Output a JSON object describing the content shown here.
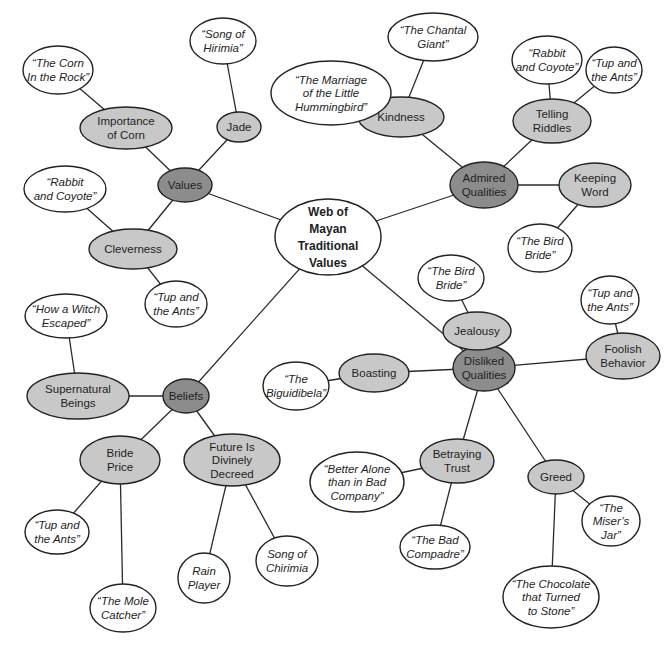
{
  "colors": {
    "center_fill": "#ffffff",
    "category_fill": "#8c8c8c",
    "subtopic_fill": "#c8c8c8",
    "story_fill": "#ffffff",
    "stroke": "#222222"
  },
  "nodes": [
    {
      "id": "center",
      "type": "center",
      "lines": [
        "Web of",
        "Mayan",
        "Traditional",
        "Values"
      ],
      "cx": 328,
      "cy": 237,
      "rx": 53,
      "ry": 38
    },
    {
      "id": "values",
      "type": "category",
      "lines": [
        "Values"
      ],
      "cx": 185,
      "cy": 185,
      "rx": 27,
      "ry": 17
    },
    {
      "id": "jade",
      "type": "subtopic",
      "lines": [
        "Jade"
      ],
      "cx": 239,
      "cy": 127,
      "rx": 22,
      "ry": 15
    },
    {
      "id": "song-hirimia",
      "type": "story",
      "lines": [
        "“Song of",
        "Hirimia”"
      ],
      "cx": 223,
      "cy": 41,
      "rx": 33,
      "ry": 23
    },
    {
      "id": "importance-corn",
      "type": "subtopic",
      "lines": [
        "Importance",
        "of Corn"
      ],
      "cx": 126,
      "cy": 128,
      "rx": 46,
      "ry": 21
    },
    {
      "id": "corn-rock",
      "type": "story",
      "lines": [
        "“The Corn",
        "In the Rock”"
      ],
      "cx": 58,
      "cy": 70,
      "rx": 35,
      "ry": 24
    },
    {
      "id": "cleverness",
      "type": "subtopic",
      "lines": [
        "Cleverness"
      ],
      "cx": 133,
      "cy": 249,
      "rx": 44,
      "ry": 20
    },
    {
      "id": "rabbit-coyote-left",
      "type": "story",
      "lines": [
        "“Rabbit",
        "and Coyote”"
      ],
      "cx": 65,
      "cy": 189,
      "rx": 41,
      "ry": 23
    },
    {
      "id": "tup-ants-cleverness",
      "type": "story",
      "lines": [
        "“Tup and",
        "the Ants”"
      ],
      "cx": 176,
      "cy": 304,
      "rx": 31,
      "ry": 23
    },
    {
      "id": "admired",
      "type": "category",
      "lines": [
        "Admired",
        "Qualities"
      ],
      "cx": 484,
      "cy": 185,
      "rx": 34,
      "ry": 23
    },
    {
      "id": "kindness",
      "type": "subtopic",
      "lines": [
        "Kindness"
      ],
      "cx": 401,
      "cy": 117,
      "rx": 43,
      "ry": 20
    },
    {
      "id": "chantal-giant",
      "type": "story",
      "lines": [
        "“The Chantal",
        "Giant”"
      ],
      "cx": 433,
      "cy": 37,
      "rx": 45,
      "ry": 24
    },
    {
      "id": "marriage-hummingbird",
      "type": "story",
      "lines": [
        "“The Marriage",
        "of the Little",
        "Hummingbird”"
      ],
      "cx": 331,
      "cy": 93,
      "rx": 60,
      "ry": 32
    },
    {
      "id": "telling-riddles",
      "type": "subtopic",
      "lines": [
        "Telling",
        "Riddles"
      ],
      "cx": 552,
      "cy": 121,
      "rx": 39,
      "ry": 22
    },
    {
      "id": "rabbit-coyote-right",
      "type": "story",
      "lines": [
        "“Rabbit",
        "and Coyote”"
      ],
      "cx": 547,
      "cy": 60,
      "rx": 35,
      "ry": 24
    },
    {
      "id": "tup-ants-riddles",
      "type": "story",
      "lines": [
        "“Tup and",
        "the Ants”"
      ],
      "cx": 614,
      "cy": 70,
      "rx": 28,
      "ry": 23
    },
    {
      "id": "keeping-word",
      "type": "subtopic",
      "lines": [
        "Keeping",
        "Word"
      ],
      "cx": 595,
      "cy": 185,
      "rx": 36,
      "ry": 22
    },
    {
      "id": "bird-bride-word",
      "type": "story",
      "lines": [
        "“The Bird",
        "Bride”"
      ],
      "cx": 540,
      "cy": 248,
      "rx": 32,
      "ry": 24
    },
    {
      "id": "disliked",
      "type": "category",
      "lines": [
        "Disliked",
        "Qualities"
      ],
      "cx": 484,
      "cy": 368,
      "rx": 31,
      "ry": 23
    },
    {
      "id": "jealousy",
      "type": "subtopic",
      "lines": [
        "Jealousy"
      ],
      "cx": 477,
      "cy": 331,
      "rx": 34,
      "ry": 19
    },
    {
      "id": "bird-bride-jealousy",
      "type": "story",
      "lines": [
        "“The Bird",
        "Bride”"
      ],
      "cx": 451,
      "cy": 278,
      "rx": 33,
      "ry": 23
    },
    {
      "id": "foolish-behavior",
      "type": "subtopic",
      "lines": [
        "Foolish",
        "Behavior"
      ],
      "cx": 623,
      "cy": 356,
      "rx": 37,
      "ry": 23
    },
    {
      "id": "tup-ants-foolish",
      "type": "story",
      "lines": [
        "“Tup and",
        "the Ants”"
      ],
      "cx": 610,
      "cy": 300,
      "rx": 29,
      "ry": 24
    },
    {
      "id": "boasting",
      "type": "subtopic",
      "lines": [
        "Boasting"
      ],
      "cx": 374,
      "cy": 373,
      "rx": 35,
      "ry": 19
    },
    {
      "id": "biguidibela",
      "type": "story",
      "lines": [
        "“The",
        "Biguidibela”"
      ],
      "cx": 296,
      "cy": 386,
      "rx": 33,
      "ry": 24
    },
    {
      "id": "betraying-trust",
      "type": "subtopic",
      "lines": [
        "Betraying",
        "Trust"
      ],
      "cx": 457,
      "cy": 461,
      "rx": 37,
      "ry": 22
    },
    {
      "id": "better-alone",
      "type": "story",
      "lines": [
        "“Better Alone",
        "than in Bad",
        "Company”"
      ],
      "cx": 357,
      "cy": 482,
      "rx": 47,
      "ry": 30
    },
    {
      "id": "bad-compadre",
      "type": "story",
      "lines": [
        "“The Bad",
        "Compadre”"
      ],
      "cx": 435,
      "cy": 547,
      "rx": 35,
      "ry": 22
    },
    {
      "id": "greed",
      "type": "subtopic",
      "lines": [
        "Greed"
      ],
      "cx": 556,
      "cy": 477,
      "rx": 28,
      "ry": 17
    },
    {
      "id": "misers-jar",
      "type": "story",
      "lines": [
        "“The",
        "Miser’s",
        "Jar”"
      ],
      "cx": 611,
      "cy": 521,
      "rx": 29,
      "ry": 25
    },
    {
      "id": "chocolate-stone",
      "type": "story",
      "lines": [
        "“The Chocolate",
        "that Turned",
        "to Stone”"
      ],
      "cx": 551,
      "cy": 597,
      "rx": 48,
      "ry": 31
    },
    {
      "id": "beliefs",
      "type": "category",
      "lines": [
        "Beliefs"
      ],
      "cx": 186,
      "cy": 396,
      "rx": 23,
      "ry": 17
    },
    {
      "id": "supernatural-beings",
      "type": "subtopic",
      "lines": [
        "Supernatural",
        "Beings"
      ],
      "cx": 78,
      "cy": 396,
      "rx": 51,
      "ry": 23
    },
    {
      "id": "witch-escaped",
      "type": "story",
      "lines": [
        "“How a Witch",
        "Escaped”"
      ],
      "cx": 66,
      "cy": 316,
      "rx": 41,
      "ry": 22
    },
    {
      "id": "bride-price",
      "type": "subtopic",
      "lines": [
        "Bride",
        "Price"
      ],
      "cx": 120,
      "cy": 460,
      "rx": 40,
      "ry": 24
    },
    {
      "id": "tup-ants-bride",
      "type": "story",
      "lines": [
        "“Tup and",
        "the Ants”"
      ],
      "cx": 57,
      "cy": 532,
      "rx": 32,
      "ry": 22
    },
    {
      "id": "mole-catcher",
      "type": "story",
      "lines": [
        "“The Mole",
        "Catcher”"
      ],
      "cx": 123,
      "cy": 608,
      "rx": 33,
      "ry": 24
    },
    {
      "id": "future-decreed",
      "type": "subtopic",
      "lines": [
        "Future Is",
        "Divinely",
        "Decreed"
      ],
      "cx": 232,
      "cy": 460,
      "rx": 48,
      "ry": 26
    },
    {
      "id": "rain-player",
      "type": "story",
      "lines": [
        "Rain",
        "Player"
      ],
      "cx": 204,
      "cy": 578,
      "rx": 26,
      "ry": 25
    },
    {
      "id": "song-chirimia",
      "type": "story",
      "lines": [
        "Song of",
        "Chirimia"
      ],
      "cx": 287,
      "cy": 561,
      "rx": 31,
      "ry": 25
    }
  ],
  "edges": [
    [
      "center",
      "values"
    ],
    [
      "center",
      "admired"
    ],
    [
      "center",
      "disliked"
    ],
    [
      "center",
      "beliefs"
    ],
    [
      "values",
      "jade"
    ],
    [
      "jade",
      "song-hirimia"
    ],
    [
      "values",
      "importance-corn"
    ],
    [
      "importance-corn",
      "corn-rock"
    ],
    [
      "values",
      "cleverness"
    ],
    [
      "cleverness",
      "rabbit-coyote-left"
    ],
    [
      "cleverness",
      "tup-ants-cleverness"
    ],
    [
      "admired",
      "kindness"
    ],
    [
      "kindness",
      "chantal-giant"
    ],
    [
      "kindness",
      "marriage-hummingbird"
    ],
    [
      "admired",
      "telling-riddles"
    ],
    [
      "telling-riddles",
      "rabbit-coyote-right"
    ],
    [
      "telling-riddles",
      "tup-ants-riddles"
    ],
    [
      "admired",
      "keeping-word"
    ],
    [
      "keeping-word",
      "bird-bride-word"
    ],
    [
      "disliked",
      "jealousy"
    ],
    [
      "jealousy",
      "bird-bride-jealousy"
    ],
    [
      "disliked",
      "foolish-behavior"
    ],
    [
      "foolish-behavior",
      "tup-ants-foolish"
    ],
    [
      "disliked",
      "boasting"
    ],
    [
      "boasting",
      "biguidibela"
    ],
    [
      "disliked",
      "betraying-trust"
    ],
    [
      "betraying-trust",
      "better-alone"
    ],
    [
      "betraying-trust",
      "bad-compadre"
    ],
    [
      "disliked",
      "greed"
    ],
    [
      "greed",
      "misers-jar"
    ],
    [
      "greed",
      "chocolate-stone"
    ],
    [
      "beliefs",
      "supernatural-beings"
    ],
    [
      "supernatural-beings",
      "witch-escaped"
    ],
    [
      "beliefs",
      "bride-price"
    ],
    [
      "bride-price",
      "tup-ants-bride"
    ],
    [
      "bride-price",
      "mole-catcher"
    ],
    [
      "beliefs",
      "future-decreed"
    ],
    [
      "future-decreed",
      "rain-player"
    ],
    [
      "future-decreed",
      "song-chirimia"
    ]
  ]
}
